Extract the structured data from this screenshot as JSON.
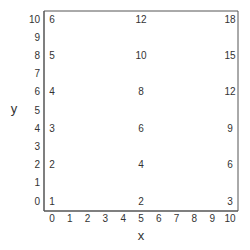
{
  "chart_data": {
    "type": "table",
    "title": "",
    "xlabel": "x",
    "ylabel": "y",
    "xlim": [
      0,
      10
    ],
    "ylim": [
      0,
      10
    ],
    "xticks": [
      0,
      1,
      2,
      3,
      4,
      5,
      6,
      7,
      8,
      9,
      10
    ],
    "yticks": [
      0,
      1,
      2,
      3,
      4,
      5,
      6,
      7,
      8,
      9,
      10
    ],
    "grid": false,
    "legend": "none",
    "points": [
      {
        "x": 0,
        "y": 0,
        "label": "1"
      },
      {
        "x": 0,
        "y": 2,
        "label": "2"
      },
      {
        "x": 0,
        "y": 4,
        "label": "3"
      },
      {
        "x": 0,
        "y": 6,
        "label": "4"
      },
      {
        "x": 0,
        "y": 8,
        "label": "5"
      },
      {
        "x": 0,
        "y": 10,
        "label": "6"
      },
      {
        "x": 5,
        "y": 0,
        "label": "2"
      },
      {
        "x": 5,
        "y": 2,
        "label": "4"
      },
      {
        "x": 5,
        "y": 4,
        "label": "6"
      },
      {
        "x": 5,
        "y": 6,
        "label": "8"
      },
      {
        "x": 5,
        "y": 8,
        "label": "10"
      },
      {
        "x": 5,
        "y": 10,
        "label": "12"
      },
      {
        "x": 10,
        "y": 0,
        "label": "3"
      },
      {
        "x": 10,
        "y": 2,
        "label": "6"
      },
      {
        "x": 10,
        "y": 4,
        "label": "9"
      },
      {
        "x": 10,
        "y": 6,
        "label": "12"
      },
      {
        "x": 10,
        "y": 8,
        "label": "15"
      },
      {
        "x": 10,
        "y": 10,
        "label": "18"
      }
    ]
  },
  "colors": {
    "frame": "#555555",
    "text": "#333333",
    "background": "#ffffff"
  }
}
